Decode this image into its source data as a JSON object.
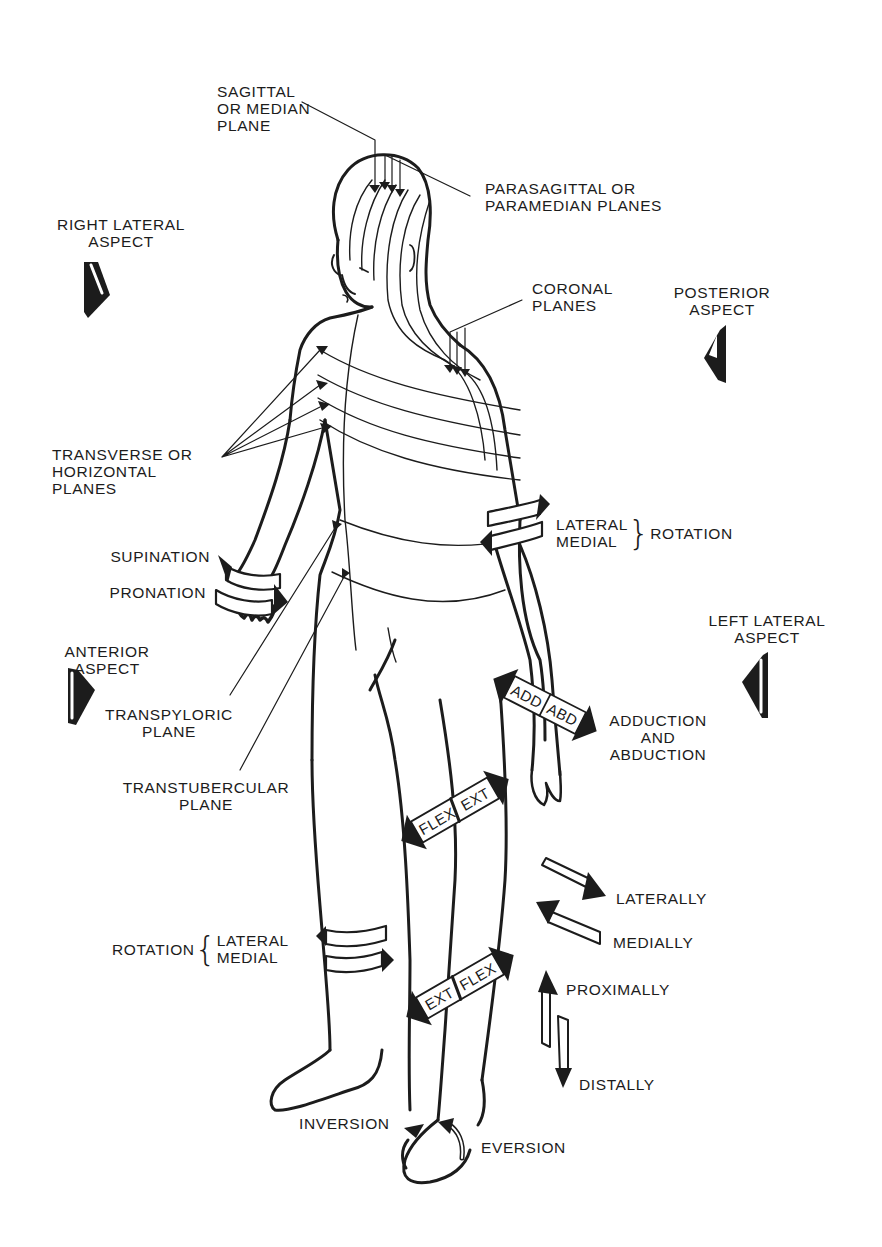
{
  "figure": {
    "ink_color": "#1c1c1c",
    "background": "#ffffff"
  },
  "planes": {
    "sagittal": [
      "SAGITTAL",
      "OR MEDIAN",
      "PLANE"
    ],
    "parasagittal": [
      "PARASAGITTAL OR",
      "PARAMEDIAN PLANES"
    ],
    "coronal": [
      "CORONAL",
      "PLANES"
    ],
    "transverse": [
      "TRANSVERSE OR",
      "HORIZONTAL",
      "PLANES"
    ],
    "transpyloric": [
      "TRANSPYLORIC",
      "PLANE"
    ],
    "transtubercular": [
      "TRANSTUBERCULAR",
      "PLANE"
    ]
  },
  "aspects": {
    "right_lateral": [
      "RIGHT LATERAL",
      "ASPECT"
    ],
    "posterior": [
      "POSTERIOR",
      "ASPECT"
    ],
    "left_lateral": [
      "LEFT LATERAL",
      "ASPECT"
    ],
    "anterior": [
      "ANTERIOR",
      "ASPECT"
    ]
  },
  "movements": {
    "forearm": {
      "supination": "SUPINATION",
      "pronation": "PRONATION"
    },
    "arm_rotation": {
      "lateral": "LATERAL",
      "medial": "MEDIAL",
      "brace": "}",
      "term": "ROTATION"
    },
    "wrist": {
      "band_left": "ADD",
      "band_right": "ABD",
      "label": [
        "ADDUCTION",
        "AND",
        "ABDUCTION"
      ]
    },
    "knee": {
      "band_left": "FLEX",
      "band_right": "EXT"
    },
    "ankle_sagittal": {
      "band_left": "EXT",
      "band_right": "FLEX"
    },
    "leg_rotation": {
      "term": "ROTATION",
      "brace": "{",
      "lateral": "LATERAL",
      "medial": "MEDIAL"
    },
    "foot": {
      "inversion": "INVERSION",
      "eversion": "EVERSION"
    }
  },
  "directions": {
    "laterally": "LATERALLY",
    "medially": "MEDIALLY",
    "proximally": "PROXIMALLY",
    "distally": "DISTALLY"
  }
}
